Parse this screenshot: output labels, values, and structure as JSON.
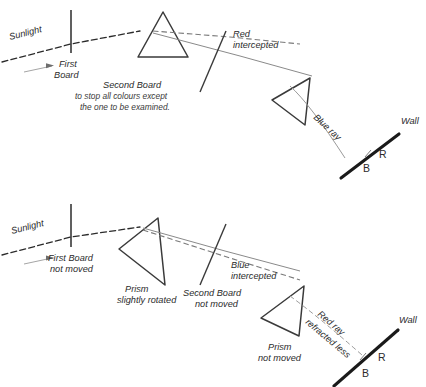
{
  "figure": {
    "background_color": "#ffffff",
    "ink_color": "#2b2b2b",
    "ray_color": "#6e6e6e"
  },
  "panels": [
    {
      "id": "top-panel",
      "name": "first-arrangement",
      "labels": {
        "sunlight": "Sunlight",
        "first_board_line1": "First",
        "first_board_line2": "Board",
        "red_intercepted_line1": "Red",
        "red_intercepted_line2": "intercepted",
        "second_board_line1": "Second Board",
        "second_board_line2": "to stop all colours except",
        "second_board_line3": "the one to be examined.",
        "blue_ray": "Blue ray",
        "wall": "Wall",
        "mark_b": "B",
        "mark_r": "R"
      }
    },
    {
      "id": "bottom-panel",
      "name": "second-arrangement",
      "labels": {
        "sunlight": "Sunlight",
        "first_board_line1": "First Board",
        "first_board_line2": "not moved",
        "prism_rotated_line1": "Prism",
        "prism_rotated_line2": "slightly rotated",
        "blue_intercepted_line1": "Blue",
        "blue_intercepted_line2": "intercepted",
        "second_board_line1": "Second Board",
        "second_board_line2": "not moved",
        "prism_not_moved_line1": "Prism",
        "prism_not_moved_line2": "not moved",
        "red_ray_line1": "Red ray",
        "red_ray_line2": "refracted less",
        "wall": "Wall",
        "mark_b": "B",
        "mark_r": "R"
      }
    }
  ]
}
